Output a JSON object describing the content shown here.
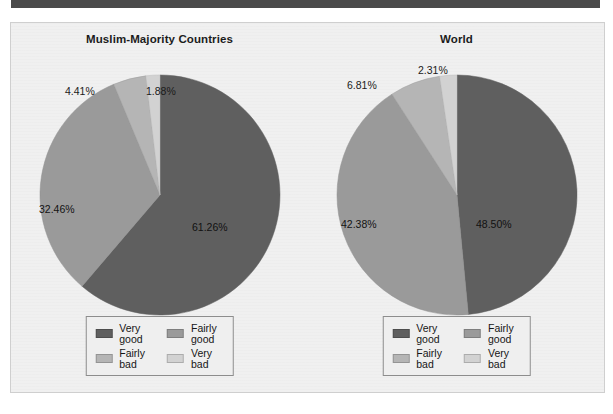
{
  "page": {
    "background_color": "#ffffff",
    "panel_background_color": "#f0f0f0",
    "panel_border_color": "#cfcfcf",
    "top_rule_color": "#4a4a4a"
  },
  "palette": {
    "very_good": "#5f5f5f",
    "fairly_good": "#9a9a9a",
    "fairly_bad": "#b5b5b5",
    "very_bad": "#d2d2d2"
  },
  "legend": {
    "items": [
      {
        "label": "Very good",
        "color": "#5f5f5f"
      },
      {
        "label": "Fairly good",
        "color": "#9a9a9a"
      },
      {
        "label": "Fairly bad",
        "color": "#b5b5b5"
      },
      {
        "label": "Very bad",
        "color": "#d2d2d2"
      }
    ]
  },
  "chart_data": [
    {
      "type": "pie",
      "title": "Muslim-Majority Countries",
      "categories": [
        "Very good",
        "Fairly good",
        "Fairly bad",
        "Very bad"
      ],
      "values": [
        61.26,
        32.46,
        4.41,
        1.88
      ],
      "labels": [
        "61.26%",
        "32.46%",
        "4.41%",
        "1.88%"
      ],
      "colors": [
        "#5f5f5f",
        "#9a9a9a",
        "#b5b5b5",
        "#d2d2d2"
      ],
      "units": "percent",
      "legend_position": "bottom",
      "start_angle_deg": 0,
      "direction": "clockwise"
    },
    {
      "type": "pie",
      "title": "World",
      "categories": [
        "Very good",
        "Fairly good",
        "Fairly bad",
        "Very bad"
      ],
      "values": [
        48.5,
        42.38,
        6.81,
        2.31
      ],
      "labels": [
        "48.50%",
        "42.38%",
        "6.81%",
        "2.31%"
      ],
      "colors": [
        "#5f5f5f",
        "#9a9a9a",
        "#b5b5b5",
        "#d2d2d2"
      ],
      "units": "percent",
      "legend_position": "bottom",
      "start_angle_deg": 0,
      "direction": "clockwise"
    }
  ]
}
